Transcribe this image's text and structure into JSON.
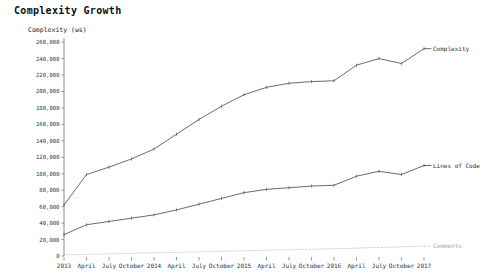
{
  "chart_data": {
    "type": "line",
    "title": "Complexity Growth",
    "ylabel": "Complexity (ws)",
    "xlabel": "",
    "ylim": [
      0,
      265000
    ],
    "grid": false,
    "legend_position": "right-inline",
    "ytick_labels": [
      "0",
      "20,000",
      "40,000",
      "60,000",
      "80,000",
      "100,000",
      "120,000",
      "140,000",
      "160,000",
      "180,000",
      "200,000",
      "220,000",
      "240,000",
      "260,000"
    ],
    "ytick_values": [
      0,
      20000,
      40000,
      60000,
      80000,
      100000,
      120000,
      140000,
      160000,
      180000,
      200000,
      220000,
      240000,
      260000
    ],
    "categories": [
      "2013",
      "April",
      "July",
      "October",
      "2014",
      "April",
      "July",
      "October",
      "2015",
      "April",
      "July",
      "October",
      "2016",
      "April",
      "July",
      "October",
      "2017"
    ],
    "x_index": [
      0,
      1,
      2,
      3,
      4,
      5,
      6,
      7,
      8,
      9,
      10,
      11,
      12,
      13,
      14,
      15,
      16
    ],
    "series": [
      {
        "name": "Complexity",
        "label": "Complexity",
        "style": "solid",
        "color": "#5a5a5a",
        "values": [
          62000,
          99000,
          108000,
          118000,
          130000,
          148000,
          166000,
          182000,
          196000,
          205000,
          210000,
          212000,
          213000,
          232000,
          240000,
          234000,
          252000
        ]
      },
      {
        "name": "Lines of Code",
        "label": "Lines of Code",
        "style": "solid",
        "color": "#5a5a5a",
        "values": [
          26000,
          38000,
          42000,
          46000,
          50000,
          56000,
          63000,
          70000,
          77000,
          81000,
          83000,
          85000,
          86000,
          97000,
          103000,
          99000,
          110000
        ]
      },
      {
        "name": "Comments",
        "label": "Comments",
        "style": "dashed",
        "color": "#c9c9c9",
        "values": [
          1500,
          2000,
          2600,
          3200,
          3800,
          4400,
          5000,
          5700,
          6400,
          7000,
          7600,
          8200,
          8800,
          9600,
          10400,
          11200,
          12000
        ]
      }
    ]
  }
}
